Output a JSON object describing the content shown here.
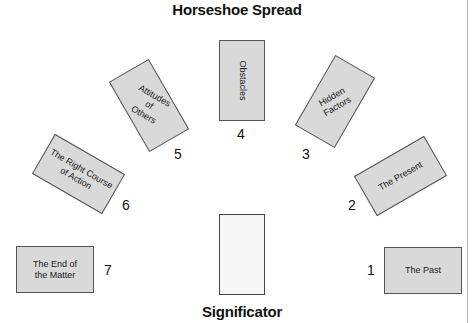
{
  "title": "Horseshoe Spread",
  "significator": {
    "label": "Significator"
  },
  "positions": [
    {
      "number": "1",
      "label": "The Past"
    },
    {
      "number": "2",
      "label": "The Present"
    },
    {
      "number": "3",
      "label": "Hidden\nFactors"
    },
    {
      "number": "4",
      "label": "Obstacles"
    },
    {
      "number": "5",
      "label": "Attitudes of\nOthers"
    },
    {
      "number": "6",
      "label": "The Right Course\nof Action"
    },
    {
      "number": "7",
      "label": "The End of\nthe Matter"
    }
  ],
  "colors": {
    "card_fill": "#d9d9d9",
    "card_border": "#555555",
    "significator_fill": "#f7f7f7",
    "text": "#111111"
  }
}
